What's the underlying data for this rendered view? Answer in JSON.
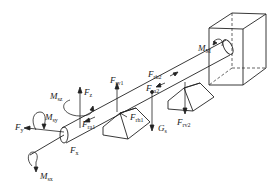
{
  "diagram": {
    "type": "shaft force/moment free-body diagram",
    "stroke_color": "#222222",
    "background": "#ffffff",
    "labels": [
      {
        "id": "M_M",
        "main": "M",
        "sub": "M",
        "x": 198,
        "y": 44
      },
      {
        "id": "F_rh2",
        "main": "F",
        "sub": "rh2",
        "x": 148,
        "y": 70
      },
      {
        "id": "F_ra2",
        "main": "F",
        "sub": "ra2",
        "x": 146,
        "y": 84
      },
      {
        "id": "F_rv1",
        "main": "F",
        "sub": "rv1",
        "x": 110,
        "y": 76
      },
      {
        "id": "F_rv2",
        "main": "F",
        "sub": "rv2",
        "x": 177,
        "y": 118
      },
      {
        "id": "M_sz",
        "main": "M",
        "sub": "sz",
        "x": 50,
        "y": 92
      },
      {
        "id": "F_z",
        "main": "F",
        "sub": "z",
        "x": 84,
        "y": 88
      },
      {
        "id": "F_rh1",
        "main": "F",
        "sub": "rh1",
        "x": 130,
        "y": 113
      },
      {
        "id": "G_s",
        "main": "G",
        "sub": "s",
        "x": 159,
        "y": 127
      },
      {
        "id": "M_sy",
        "main": "M",
        "sub": "sy",
        "x": 45,
        "y": 115
      },
      {
        "id": "F_ra1",
        "main": "F",
        "sub": "ra1",
        "x": 82,
        "y": 120
      },
      {
        "id": "F_y",
        "main": "F",
        "sub": "y",
        "x": 15,
        "y": 123
      },
      {
        "id": "F_x",
        "main": "F",
        "sub": "x",
        "x": 70,
        "y": 146
      },
      {
        "id": "M_sx",
        "main": "M",
        "sub": "sx",
        "x": 40,
        "y": 172
      }
    ]
  }
}
